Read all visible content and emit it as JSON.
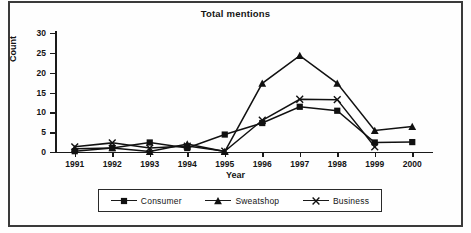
{
  "chart_data": {
    "type": "line",
    "title": "Total mentions",
    "xlabel": "Year",
    "ylabel": "Count",
    "categories": [
      "1991",
      "1992",
      "1993",
      "1994",
      "1995",
      "1996",
      "1997",
      "1998",
      "1999",
      "2000"
    ],
    "ylim": [
      0,
      30
    ],
    "yticks": [
      0,
      5,
      10,
      15,
      20,
      25,
      30
    ],
    "grid": false,
    "legend_position": "bottom",
    "series": [
      {
        "name": "Consumer",
        "marker": "square",
        "values": [
          0.2,
          1.0,
          2.4,
          1.0,
          4.4,
          7.3,
          11.4,
          10.4,
          2.4,
          2.5
        ]
      },
      {
        "name": "Sweatshop",
        "marker": "triangle",
        "values": [
          0.8,
          1.0,
          0.1,
          2.0,
          0.1,
          17.3,
          24.3,
          17.3,
          5.4,
          6.4
        ]
      },
      {
        "name": "Business",
        "marker": "x",
        "values": [
          1.3,
          2.3,
          1.0,
          1.5,
          0.2,
          8.0,
          13.3,
          13.2,
          1.3,
          null
        ]
      }
    ]
  },
  "legend": {
    "items": [
      {
        "label": "Consumer"
      },
      {
        "label": "Sweatshop"
      },
      {
        "label": "Business"
      }
    ]
  },
  "colors": {
    "ink": "#111111",
    "axis": "#1a1a1a",
    "background": "#ffffff"
  }
}
